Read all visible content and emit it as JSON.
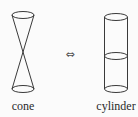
{
  "diagram": {
    "left_shape": {
      "name": "cone",
      "label": "cone",
      "description": "double cone (two cones joined at apex)"
    },
    "relation": {
      "symbol": "⇔",
      "meaning": "bidirectional equivalence"
    },
    "right_shape": {
      "name": "cylinder",
      "label": "cylinder",
      "description": "cylinder with middle cross-section ellipse"
    },
    "colors": {
      "stroke": "#3a3a3a",
      "background": "#fbfbfb",
      "text": "#2a2a2a"
    }
  }
}
